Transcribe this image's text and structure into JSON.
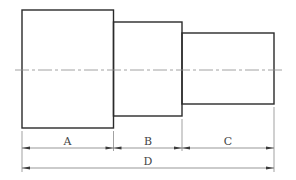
{
  "drawing": {
    "title": "Stepped shaft dimension drawing",
    "sections": [
      {
        "name": "section-a",
        "label": "A"
      },
      {
        "name": "section-b",
        "label": "B"
      },
      {
        "name": "section-c",
        "label": "C"
      }
    ],
    "dimensions": {
      "a": "A",
      "b": "B",
      "c": "C",
      "overall": "D"
    },
    "colors": {
      "outline": "#2a2a2a",
      "centerline": "#8a8a8a",
      "dimension": "#6a6a6a",
      "text": "#444444"
    }
  }
}
